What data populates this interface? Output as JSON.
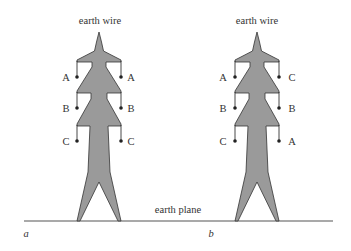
{
  "diagram": {
    "type": "transmission-tower-phase-arrangement",
    "colors": {
      "tower_fill": "#9a9a9a",
      "outline": "#333333",
      "background": "#ffffff"
    },
    "ground_label": "earth plane",
    "towers": [
      {
        "id": "a",
        "caption": "a",
        "top_label": "earth wire",
        "left_phases": [
          "A",
          "B",
          "C"
        ],
        "right_phases": [
          "A",
          "B",
          "C"
        ]
      },
      {
        "id": "b",
        "caption": "b",
        "top_label": "earth wire",
        "left_phases": [
          "A",
          "B",
          "C"
        ],
        "right_phases": [
          "C",
          "B",
          "A"
        ]
      }
    ]
  }
}
